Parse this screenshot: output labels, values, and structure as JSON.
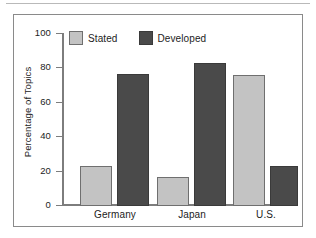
{
  "chart_data": {
    "type": "bar",
    "title": "",
    "subtitle": "",
    "xlabel": "",
    "ylabel": "Percentage of Topics",
    "categories": [
      "Germany",
      "Japan",
      "U.S."
    ],
    "series": [
      {
        "name": "Stated",
        "color": "#c3c3c3",
        "values": [
          23,
          17,
          76
        ]
      },
      {
        "name": "Developed",
        "color": "#4a4a4a",
        "values": [
          77,
          83,
          23
        ]
      }
    ],
    "ylim": [
      0,
      100
    ],
    "yticks": [
      0,
      20,
      40,
      60,
      80,
      100
    ],
    "ytick_labels": [
      "0",
      "20",
      "40",
      "60",
      "80",
      "100"
    ],
    "grid": false,
    "legend_position": "top-left-inside",
    "legend_entries": [
      "Stated",
      "Developed"
    ]
  },
  "figure": {
    "frame_border_color": "#8a8a8a",
    "axis_color": "#7d7d7d",
    "background": "#ffffff"
  }
}
